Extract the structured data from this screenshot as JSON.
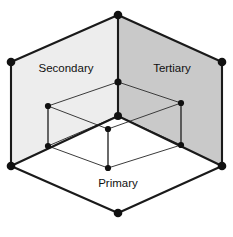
{
  "diagram": {
    "type": "isometric-nested-volumes",
    "canvas": {
      "width": 233,
      "height": 237,
      "background": "#ffffff"
    },
    "labels": {
      "secondary": "Secondary",
      "tertiary": "Tertiary",
      "primary": "Primary"
    },
    "label_positions": {
      "secondary": {
        "x": 66,
        "y": 72
      },
      "tertiary": {
        "x": 172,
        "y": 72
      },
      "primary": {
        "x": 118,
        "y": 187
      }
    },
    "colors": {
      "secondary_wall": "#ededed",
      "tertiary_wall": "#c9c9c9",
      "primary_floor": "#ffffff",
      "edge_dark": "#1a1a1a",
      "edge_light": "#3b3b3b",
      "vertex": "#111111",
      "label_text": "#111111"
    },
    "outer_vertices": {
      "top_apex": {
        "x": 118,
        "y": 15
      },
      "left_top": {
        "x": 11,
        "y": 62
      },
      "right_top": {
        "x": 222,
        "y": 62
      },
      "left_bottom": {
        "x": 11,
        "y": 166
      },
      "right_bottom": {
        "x": 222,
        "y": 166
      },
      "bottom_apex": {
        "x": 118,
        "y": 213
      },
      "center_back": {
        "x": 118,
        "y": 82
      },
      "center_front": {
        "x": 118,
        "y": 116
      }
    },
    "inner_vertices": {
      "left_top": {
        "x": 48,
        "y": 106
      },
      "left_bottom": {
        "x": 48,
        "y": 146
      },
      "right_top": {
        "x": 181,
        "y": 103
      },
      "right_bottom": {
        "x": 181,
        "y": 145
      },
      "front_top": {
        "x": 108,
        "y": 129
      },
      "front_bottom": {
        "x": 108,
        "y": 168
      }
    },
    "faces": [
      {
        "name": "secondary-wall",
        "fill": "#ededed",
        "points": "118,15 11,62 11,166 118,116"
      },
      {
        "name": "tertiary-wall",
        "fill": "#c9c9c9",
        "points": "118,15 222,62 222,166 118,116"
      },
      {
        "name": "primary-floor",
        "fill": "#ffffff",
        "points": "11,166 118,116 222,166 118,213"
      }
    ]
  }
}
